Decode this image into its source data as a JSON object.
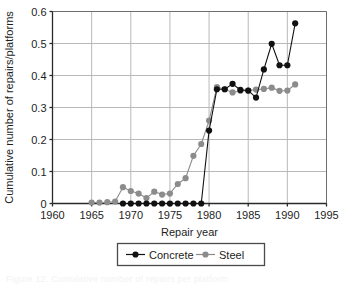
{
  "chart_data": {
    "type": "line",
    "title": "",
    "xlabel": "Repair year",
    "ylabel": "Cumulative number of repairs/platforms",
    "xlim": [
      1960,
      1995
    ],
    "ylim": [
      0,
      0.6
    ],
    "xticks": [
      1960,
      1965,
      1970,
      1975,
      1980,
      1985,
      1990,
      1995
    ],
    "xtick_labels": [
      "1960",
      "1965",
      "1970",
      "1975",
      "1980",
      "1985",
      "1990",
      "1995"
    ],
    "yticks": [
      0,
      0.1,
      0.2,
      0.3,
      0.4,
      0.5,
      0.6
    ],
    "ytick_labels": [
      "0",
      "0.1",
      "0.2",
      "0.3",
      "0.4",
      "0.5",
      "0.6"
    ],
    "grid": true,
    "legend_position": "bottom-center",
    "markers": "filled-circle",
    "series": [
      {
        "name": "Concrete",
        "color": "#111111",
        "x": [
          1969,
          1970,
          1971,
          1972,
          1973,
          1974,
          1975,
          1976,
          1977,
          1978,
          1979,
          1980,
          1981,
          1982,
          1983,
          1984,
          1985,
          1986,
          1987,
          1988,
          1989,
          1990,
          1991
        ],
        "values": [
          0,
          0,
          0,
          0,
          0,
          0,
          0,
          0,
          0,
          0,
          0,
          0.228,
          0.357,
          0.357,
          0.374,
          0.355,
          0.353,
          0.331,
          0.419,
          0.499,
          0.432,
          0.432,
          0.563
        ]
      },
      {
        "name": "Steel",
        "color": "#8c8c8c",
        "x": [
          1965,
          1966,
          1967,
          1968,
          1969,
          1970,
          1971,
          1972,
          1973,
          1974,
          1975,
          1976,
          1977,
          1978,
          1979,
          1980,
          1981,
          1982,
          1983,
          1984,
          1985,
          1986,
          1987,
          1988,
          1989,
          1990,
          1991
        ],
        "values": [
          0.003,
          0.003,
          0.004,
          0.006,
          0.051,
          0.039,
          0.031,
          0.017,
          0.037,
          0.028,
          0.031,
          0.061,
          0.079,
          0.149,
          0.186,
          0.259,
          0.364,
          0.357,
          0.347,
          0.352,
          0.353,
          0.356,
          0.358,
          0.362,
          0.352,
          0.353,
          0.372
        ]
      }
    ]
  },
  "legend": {
    "items": [
      {
        "label": "Concrete",
        "color": "#111111"
      },
      {
        "label": "Steel",
        "color": "#8c8c8c"
      }
    ]
  },
  "caption": {
    "text": "Figure 12.  Cumulative number of repairs per platform"
  }
}
